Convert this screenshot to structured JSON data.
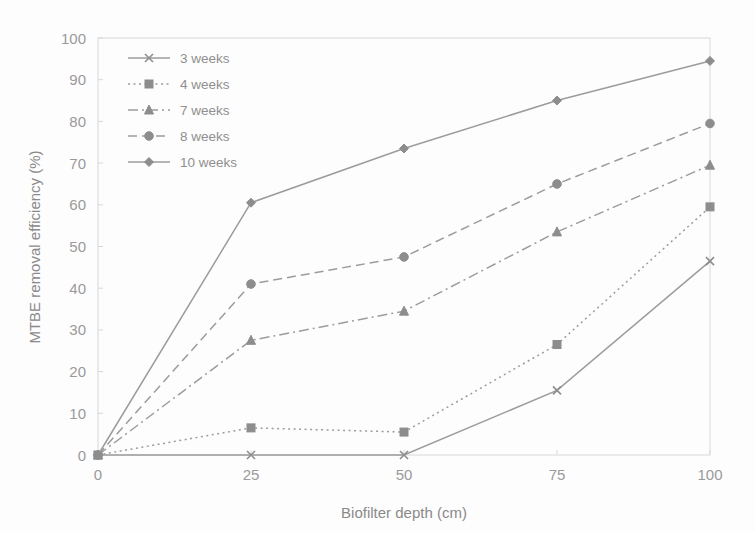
{
  "chart_data": {
    "type": "line",
    "title": "",
    "xlabel": "Biofilter depth (cm)",
    "ylabel": "MTBE removal efficiency (%)",
    "x": [
      0,
      25,
      50,
      75,
      100
    ],
    "xticks": [
      "0",
      "25",
      "50",
      "75",
      "100"
    ],
    "yticks": [
      "0",
      "10",
      "20",
      "30",
      "40",
      "50",
      "60",
      "70",
      "80",
      "90",
      "100"
    ],
    "xlim": [
      0,
      100
    ],
    "ylim": [
      0,
      100
    ],
    "grid": false,
    "legend_position": "top-left inside plot area",
    "series": [
      {
        "name": "3 weeks",
        "values": [
          0,
          0,
          0,
          15.5,
          46.5
        ],
        "marker": "x-cross",
        "dash": "solid",
        "color": "#9c9c9c"
      },
      {
        "name": "4 weeks",
        "values": [
          0,
          6.5,
          5.5,
          26.5,
          59.5
        ],
        "marker": "square",
        "dash": "dotted",
        "color": "#9c9c9c"
      },
      {
        "name": "7 weeks",
        "values": [
          0,
          27.5,
          34.5,
          53.5,
          69.5
        ],
        "marker": "triangle",
        "dash": "dash-dot",
        "color": "#9c9c9c"
      },
      {
        "name": "8 weeks",
        "values": [
          0,
          41.0,
          47.5,
          65.0,
          79.5
        ],
        "marker": "circle",
        "dash": "dashed",
        "color": "#9c9c9c"
      },
      {
        "name": "10 weeks",
        "values": [
          0,
          60.5,
          73.5,
          85.0,
          94.5
        ],
        "marker": "diamond",
        "dash": "solid",
        "color": "#9c9c9c"
      }
    ]
  },
  "colors": {
    "background": "#fdfdfd",
    "axis": "#d8d8d8",
    "text": "#8f8f8f",
    "line": "#9c9c9c",
    "marker": "#8d8d8d"
  }
}
